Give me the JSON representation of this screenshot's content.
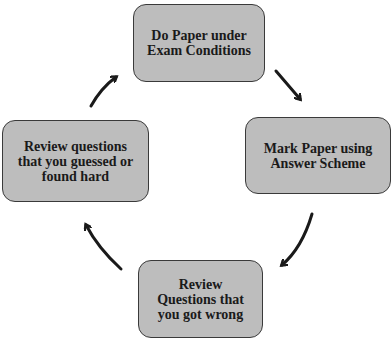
{
  "diagram": {
    "type": "cycle",
    "colors": {
      "node_fill": "#bdbdbd",
      "node_border": "#3a3a3a",
      "arrow": "#1a1a1a",
      "text": "#1a1a1a"
    },
    "nodes": [
      {
        "id": "do-paper",
        "label": "Do Paper under\nExam Conditions"
      },
      {
        "id": "mark-paper",
        "label": "Mark Paper using\nAnswer Scheme"
      },
      {
        "id": "review-wrong",
        "label": "Review\nQuestions that\nyou got wrong"
      },
      {
        "id": "review-guessed",
        "label": "Review questions\nthat you guessed or\nfound hard"
      }
    ],
    "edges": [
      {
        "from": "do-paper",
        "to": "mark-paper"
      },
      {
        "from": "mark-paper",
        "to": "review-wrong"
      },
      {
        "from": "review-wrong",
        "to": "review-guessed"
      },
      {
        "from": "review-guessed",
        "to": "do-paper"
      }
    ]
  }
}
